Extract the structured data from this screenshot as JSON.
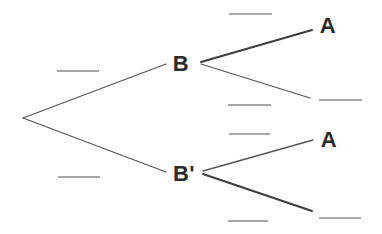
{
  "diagram": {
    "type": "probability-tree",
    "background_color": "#ffffff",
    "branch_color": "#555555",
    "blank_line_color": "#8a8a8a",
    "label_color": "#2b2b2b",
    "labels": {
      "level1_upper": "B",
      "level1_lower": "B'",
      "level2_upper_from_b": "A",
      "level2_upper_from_bprime": "A"
    },
    "structure": {
      "root": {
        "children": [
          {
            "node": "B",
            "probability": "",
            "children": [
              {
                "node": "A",
                "probability": ""
              },
              {
                "node": "",
                "probability": ""
              }
            ]
          },
          {
            "node": "B'",
            "probability": "",
            "children": [
              {
                "node": "A",
                "probability": ""
              },
              {
                "node": "",
                "probability": ""
              }
            ]
          }
        ]
      },
      "blank_count": 8
    }
  }
}
